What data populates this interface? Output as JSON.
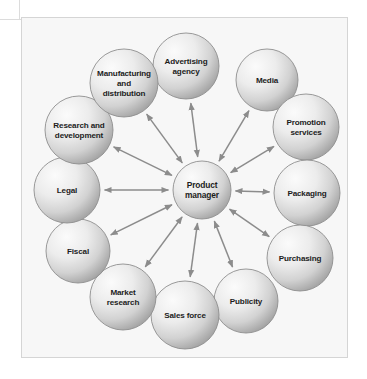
{
  "figure": {
    "type": "hub-and-spoke-diagram",
    "title": "",
    "background_color": "#f7f7f7",
    "frame_color": "#d5d5d5",
    "node_fill_light": "#f2f2f2",
    "node_fill_dark": "#9a9a9a",
    "node_stroke": "#8e8e8e",
    "arrow_color": "#8c8c8c",
    "label_color": "#1c1c1c"
  },
  "center": {
    "id": "product-manager",
    "label_lines": [
      "Product",
      "manager"
    ],
    "cx": 180,
    "cy": 172,
    "r": 29
  },
  "spokes": [
    {
      "id": "advertising-agency",
      "label_lines": [
        "Advertising",
        "agency"
      ],
      "cx": 164,
      "cy": 48,
      "r": 33,
      "arrow": "double"
    },
    {
      "id": "media",
      "label_lines": [
        "Media"
      ],
      "cx": 245,
      "cy": 62,
      "r": 31,
      "arrow": "double"
    },
    {
      "id": "promotion-services",
      "label_lines": [
        "Promotion",
        "services"
      ],
      "cx": 284,
      "cy": 109,
      "r": 33,
      "arrow": "double"
    },
    {
      "id": "packaging",
      "label_lines": [
        "Packaging"
      ],
      "cx": 285,
      "cy": 175,
      "r": 33,
      "arrow": "double"
    },
    {
      "id": "purchasing",
      "label_lines": [
        "Purchasing"
      ],
      "cx": 278,
      "cy": 240,
      "r": 33,
      "arrow": "double"
    },
    {
      "id": "publicity",
      "label_lines": [
        "Publicity"
      ],
      "cx": 224,
      "cy": 283,
      "r": 32,
      "arrow": "double"
    },
    {
      "id": "sales-force",
      "label_lines": [
        "Sales force"
      ],
      "cx": 163,
      "cy": 297,
      "r": 34,
      "arrow": "double"
    },
    {
      "id": "market-research",
      "label_lines": [
        "Market",
        "research"
      ],
      "cx": 101,
      "cy": 279,
      "r": 33,
      "arrow": "double"
    },
    {
      "id": "fiscal",
      "label_lines": [
        "Fiscal"
      ],
      "cx": 56,
      "cy": 233,
      "r": 32,
      "arrow": "double"
    },
    {
      "id": "legal",
      "label_lines": [
        "Legal"
      ],
      "cx": 45,
      "cy": 172,
      "r": 33,
      "arrow": "double"
    },
    {
      "id": "research-and-development",
      "label_lines": [
        "Research and",
        "development"
      ],
      "cx": 57,
      "cy": 112,
      "r": 34,
      "arrow": "double"
    },
    {
      "id": "manufacturing-and-distribution",
      "label_lines": [
        "Manufacturing",
        "and",
        "distribution"
      ],
      "cx": 102,
      "cy": 65,
      "r": 34,
      "arrow": "double"
    }
  ]
}
